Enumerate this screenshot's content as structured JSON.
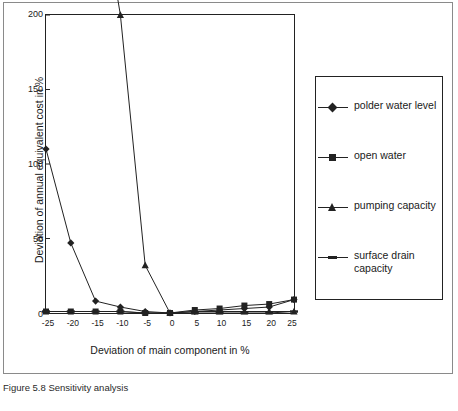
{
  "chart_data": {
    "type": "line",
    "title": "",
    "xlabel": "Deviation of main component in %",
    "ylabel": "Deviation of annual equivalent cost in %",
    "x": [
      -25,
      -20,
      -15,
      -10,
      -5,
      0,
      5,
      10,
      15,
      20,
      25
    ],
    "xtick_labels": [
      "-25",
      "-20",
      "-15",
      "-10",
      "-5",
      "0",
      "5",
      "10",
      "15",
      "20",
      "25"
    ],
    "ytick_labels": [
      "0",
      "50",
      "100",
      "150",
      "200"
    ],
    "yticks": [
      0,
      50,
      100,
      150,
      200
    ],
    "ylim": [
      0,
      200
    ],
    "grid": false,
    "legend_position": "right",
    "series": [
      {
        "name": "polder water level",
        "marker": "diamond",
        "values": [
          110,
          47,
          8,
          4,
          1,
          0,
          1,
          2,
          3,
          4,
          9
        ]
      },
      {
        "name": "open water",
        "marker": "square",
        "values": [
          1,
          1,
          1,
          1,
          0,
          0,
          2,
          3,
          5,
          6,
          9
        ]
      },
      {
        "name": "pumping capacity",
        "marker": "triangle",
        "values": [
          360,
          330,
          300,
          200,
          32,
          0,
          1,
          1,
          1,
          1,
          1
        ]
      },
      {
        "name": "surface drain capacity",
        "marker": "dash",
        "values": [
          1,
          1,
          1,
          1,
          0,
          0,
          0,
          0,
          0,
          0,
          1
        ]
      }
    ]
  },
  "legend": {
    "items": [
      {
        "label": "polder water level"
      },
      {
        "label": "open water"
      },
      {
        "label": "pumping capacity"
      },
      {
        "label": "surface drain capacity"
      }
    ]
  },
  "caption": {
    "text": "Figure 5.8 Sensitivity analysis"
  },
  "colors": {
    "axis": "#222222",
    "series": "#222222",
    "background": "#ffffff"
  }
}
